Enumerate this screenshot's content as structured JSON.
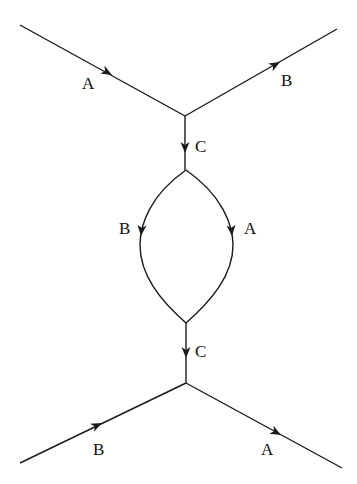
{
  "diagram": {
    "type": "feynman-loop-diagram",
    "labels": {
      "top_in": "A",
      "top_out": "B",
      "top_mid": "C",
      "loop_left": "B",
      "loop_right": "A",
      "bottom_mid": "C",
      "bottom_in": "B",
      "bottom_out": "A"
    },
    "edges": [
      {
        "from": "top-left-end",
        "to": "top-vertex",
        "label": "A"
      },
      {
        "from": "top-vertex",
        "to": "top-right-end",
        "label": "B"
      },
      {
        "from": "top-vertex",
        "to": "loop-top",
        "label": "C"
      },
      {
        "from": "loop-top",
        "to": "loop-bottom",
        "label": "B",
        "side": "left"
      },
      {
        "from": "loop-top",
        "to": "loop-bottom",
        "label": "A",
        "side": "right"
      },
      {
        "from": "loop-bottom",
        "to": "bottom-vertex",
        "label": "C"
      },
      {
        "from": "bottom-left-end",
        "to": "bottom-vertex",
        "label": "B"
      },
      {
        "from": "bottom-vertex",
        "to": "bottom-right-end",
        "label": "A"
      }
    ]
  }
}
